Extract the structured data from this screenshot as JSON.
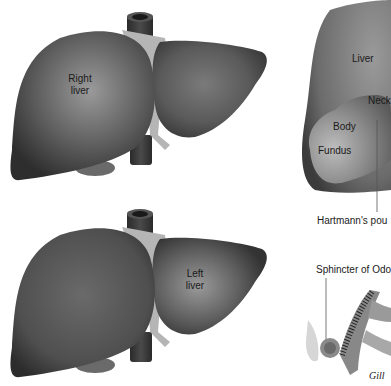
{
  "figure": {
    "panels": [
      {
        "id": "liver-top",
        "label_line1": "Right",
        "label_line2": "liver"
      },
      {
        "id": "liver-bottom",
        "label_line1": "Left",
        "label_line2": "liver"
      },
      {
        "id": "gallbladder",
        "labels": {
          "liver": "Liver",
          "neck": "Neck",
          "body": "Body",
          "fundus": "Fundus",
          "hartmann": "Hartmann's pou"
        }
      },
      {
        "id": "sphincter",
        "labels": {
          "sphincter": "Sphincter of Odo"
        },
        "signature": "Gill"
      }
    ],
    "colors": {
      "liver_fill": "#5a5a5a",
      "liver_highlight": "#8c8c8c",
      "ligament": "#b8b8b8",
      "vessel": "#3a3a3a",
      "background": "#ffffff"
    }
  }
}
